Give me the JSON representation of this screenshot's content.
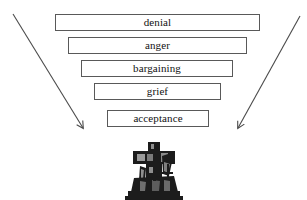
{
  "diagram": {
    "background_color": "#ffffff",
    "box_border_color": "#595959",
    "text_color": "#111111",
    "stages": [
      {
        "label": "denial",
        "left": 55,
        "top": 14,
        "width": 205,
        "height": 17
      },
      {
        "label": "anger",
        "left": 68,
        "top": 37,
        "width": 179,
        "height": 17
      },
      {
        "label": "bargaining",
        "left": 81,
        "top": 60,
        "width": 152,
        "height": 17
      },
      {
        "label": "grief",
        "left": 94,
        "top": 83,
        "width": 127,
        "height": 17
      },
      {
        "label": "acceptance",
        "left": 107,
        "top": 110,
        "width": 102,
        "height": 17
      }
    ],
    "arrows": [
      {
        "name": "left-converging-arrow",
        "x1": 13,
        "y1": 14,
        "x2": 83,
        "y2": 128,
        "color": "#4a4a4a"
      },
      {
        "name": "right-converging-arrow",
        "x1": 300,
        "y1": 16,
        "x2": 238,
        "y2": 128,
        "color": "#4a4a4a"
      }
    ],
    "image": {
      "name": "crucifix-monument-photo",
      "alt_text": "cross monument",
      "color": "#1a1a1a",
      "left": 120,
      "top": 142,
      "width": 68,
      "height": 58
    }
  }
}
